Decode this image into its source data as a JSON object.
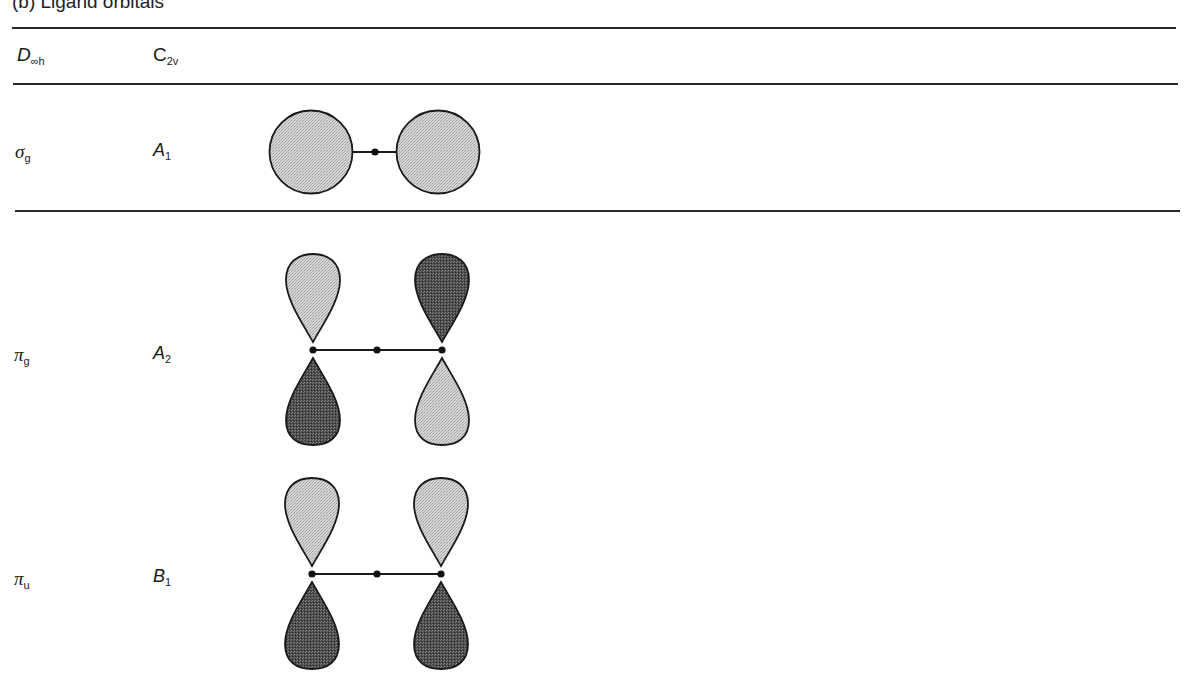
{
  "figure": {
    "title": "(b) Ligand orbitals"
  },
  "table": {
    "headers": {
      "col1_main": "D",
      "col1_sub": "∞h",
      "col2_main": "C",
      "col2_sub": "2v"
    },
    "rows": [
      {
        "dinfh_main": "σ",
        "dinfh_sub": "g",
        "c2v_main": "A",
        "c2v_sub": "1",
        "diagram": "two filled s-type spheres bonded to central atom (both light/same phase)"
      },
      {
        "dinfh_main": "π",
        "dinfh_sub": "g",
        "c2v_main": "A",
        "c2v_sub": "2",
        "diagram": "p lobes: left up light / down dark; right up dark / down light"
      },
      {
        "dinfh_main": "π",
        "dinfh_sub": "u",
        "c2v_main": "B",
        "c2v_sub": "1",
        "diagram": "p lobes: both up light / both down dark"
      }
    ]
  },
  "colors": {
    "light_lobe": "#c9c9c9",
    "dark_lobe": "#5a5a5a",
    "outline": "#1a1a1a",
    "rule": "#2a2a2a"
  }
}
